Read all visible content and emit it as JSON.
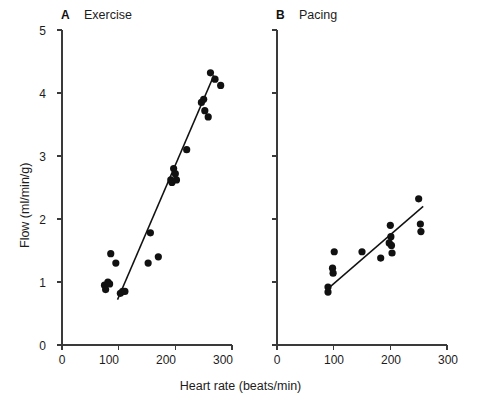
{
  "figure": {
    "xlabel": "Heart rate (beats/min)",
    "ylabel": "Flow (ml/min/g)",
    "panelA_letter": "A",
    "panelA_title": "Exercise",
    "panelB_letter": "B",
    "panelB_title": "Pacing",
    "ink_color": "#111111",
    "axis_color": "#3a3a3a",
    "background": "#ffffff"
  },
  "ticks": {
    "y_labels": [
      "0",
      "1",
      "2",
      "3",
      "4",
      "5"
    ],
    "x_labels": [
      "0",
      "100",
      "200",
      "300"
    ]
  },
  "chart_data": [
    {
      "type": "scatter",
      "panel": "A",
      "title": "Exercise",
      "panel_letter": "A",
      "xlabel": "Heart rate (beats/min)",
      "ylabel": "Flow (ml/min/g)",
      "xlim": [
        0,
        300
      ],
      "ylim": [
        0,
        5
      ],
      "xticks": [
        0,
        100,
        200,
        300
      ],
      "yticks": [
        0,
        1,
        2,
        3,
        4,
        5
      ],
      "grid": false,
      "legend": "none",
      "marker": "filled-circle",
      "points": [
        {
          "x": 75,
          "y": 0.95
        },
        {
          "x": 77,
          "y": 0.88
        },
        {
          "x": 81,
          "y": 1.0
        },
        {
          "x": 84,
          "y": 0.97
        },
        {
          "x": 86,
          "y": 1.45
        },
        {
          "x": 95,
          "y": 1.3
        },
        {
          "x": 103,
          "y": 0.82
        },
        {
          "x": 107,
          "y": 0.85
        },
        {
          "x": 111,
          "y": 0.85
        },
        {
          "x": 152,
          "y": 1.3
        },
        {
          "x": 156,
          "y": 1.78
        },
        {
          "x": 170,
          "y": 1.4
        },
        {
          "x": 192,
          "y": 2.62
        },
        {
          "x": 194,
          "y": 2.58
        },
        {
          "x": 197,
          "y": 2.8
        },
        {
          "x": 200,
          "y": 2.72
        },
        {
          "x": 202,
          "y": 2.62
        },
        {
          "x": 220,
          "y": 3.1
        },
        {
          "x": 246,
          "y": 3.85
        },
        {
          "x": 250,
          "y": 3.9
        },
        {
          "x": 252,
          "y": 3.72
        },
        {
          "x": 258,
          "y": 3.62
        },
        {
          "x": 262,
          "y": 4.32
        },
        {
          "x": 270,
          "y": 4.22
        },
        {
          "x": 280,
          "y": 4.12
        }
      ],
      "fit_line": {
        "x0": 98,
        "y0": 0.72,
        "x1": 268,
        "y1": 4.28
      }
    },
    {
      "type": "scatter",
      "panel": "B",
      "title": "Pacing",
      "panel_letter": "B",
      "xlabel": "Heart rate (beats/min)",
      "ylabel": "Flow (ml/min/g)",
      "xlim": [
        0,
        300
      ],
      "ylim": [
        0,
        5
      ],
      "xticks": [
        0,
        100,
        200,
        300
      ],
      "yticks": [
        0,
        1,
        2,
        3,
        4,
        5
      ],
      "grid": false,
      "legend": "none",
      "marker": "filled-circle",
      "points": [
        {
          "x": 90,
          "y": 0.92
        },
        {
          "x": 90,
          "y": 0.84
        },
        {
          "x": 98,
          "y": 1.22
        },
        {
          "x": 99,
          "y": 1.14
        },
        {
          "x": 101,
          "y": 1.48
        },
        {
          "x": 150,
          "y": 1.48
        },
        {
          "x": 183,
          "y": 1.38
        },
        {
          "x": 198,
          "y": 1.62
        },
        {
          "x": 200,
          "y": 1.9
        },
        {
          "x": 201,
          "y": 1.72
        },
        {
          "x": 202,
          "y": 1.58
        },
        {
          "x": 203,
          "y": 1.46
        },
        {
          "x": 250,
          "y": 2.32
        },
        {
          "x": 253,
          "y": 1.92
        },
        {
          "x": 254,
          "y": 1.8
        }
      ],
      "fit_line": {
        "x0": 88,
        "y0": 0.88,
        "x1": 258,
        "y1": 2.2
      }
    }
  ]
}
